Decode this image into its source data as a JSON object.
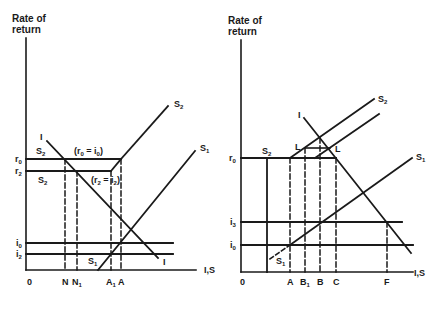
{
  "left_panel": {
    "y_axis_title_line1": "Rate of",
    "y_axis_title_line2": "return",
    "x_axis_label": "I,S",
    "origin_label": "0",
    "y_ticks": [
      {
        "base": "r",
        "sub": "0"
      },
      {
        "base": "r",
        "sub": "2"
      },
      {
        "base": "i",
        "sub": "0"
      },
      {
        "base": "i",
        "sub": "2"
      }
    ],
    "x_ticks": [
      {
        "base": "N",
        "sub": ""
      },
      {
        "base": "N",
        "sub": "1"
      },
      {
        "base": "A",
        "sub": "1"
      },
      {
        "base": "A",
        "sub": ""
      }
    ],
    "curve_labels": {
      "I_top": "I",
      "I_bottom": "I",
      "S2_top": "S",
      "S2_top_sub": "2",
      "S1_top": "S",
      "S1_top_sub": "1",
      "S1_bottom": "S",
      "S1_bottom_sub": "1",
      "S2_r0": "S",
      "S2_r0_sub": "2",
      "S2_r2": "S",
      "S2_r2_sub": "2"
    },
    "annotations": {
      "eq1_open": "(r",
      "eq1_sub1": "0",
      "eq1_mid": " = i",
      "eq1_sub2": "0",
      "eq1_close": ")",
      "eq2_open": "(r",
      "eq2_sub1": "2",
      "eq2_mid": " = i",
      "eq2_sub2": "2",
      "eq2_close": ")"
    }
  },
  "right_panel": {
    "y_axis_title_line1": "Rate of",
    "y_axis_title_line2": "return",
    "x_axis_label": "I,S",
    "origin_label": "0",
    "y_ticks": [
      {
        "base": "r",
        "sub": "0"
      },
      {
        "base": "i",
        "sub": "3"
      },
      {
        "base": "i",
        "sub": "0"
      }
    ],
    "x_ticks": [
      {
        "base": "A",
        "sub": ""
      },
      {
        "base": "B",
        "sub": "1"
      },
      {
        "base": "B",
        "sub": ""
      },
      {
        "base": "C",
        "sub": ""
      },
      {
        "base": "F",
        "sub": ""
      }
    ],
    "curve_labels": {
      "I_top": "I",
      "S2_top": "S",
      "S2_top_sub": "2",
      "S1_top": "S",
      "S1_top_sub": "1",
      "S1_bottom": "S",
      "S1_bottom_sub": "1",
      "S2_r0": "S",
      "S2_r0_sub": "2",
      "L_left": "L",
      "L_right": "L"
    }
  }
}
